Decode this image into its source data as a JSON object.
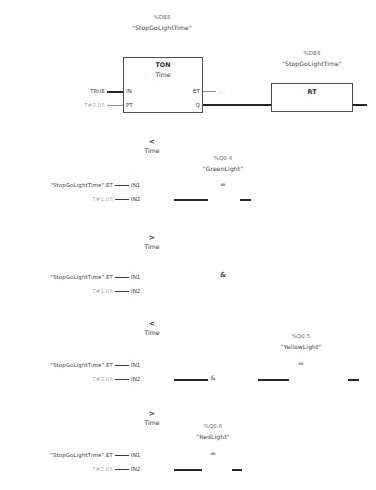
{
  "editor": {
    "language": "FBD",
    "network_title": "Traffic light timing network"
  },
  "timer": {
    "db_address": "%DB8",
    "db_name": "\"StopGoLightTime\"",
    "block_type": "TON",
    "block_subtype": "Time",
    "input_pins": [
      "IN",
      "PT"
    ],
    "output_pins": [
      "ET",
      "Q"
    ],
    "in_value": "TRUE",
    "pt_value": "T#3.0S",
    "et_value": "...",
    "reset": {
      "db_address": "%DB8",
      "db_name": "\"StopGoLightTime\"",
      "block_type": "RT"
    }
  },
  "comparators": [
    {
      "operator": "<",
      "data_type": "Time",
      "in1_label": "\"StopGoLightTime\".ET",
      "in1_pin": "IN1",
      "in2_label": "T#1.0S",
      "in2_pin": "IN2"
    },
    {
      "operator": ">",
      "data_type": "Time",
      "in1_label": "\"StopGoLightTime\".ET",
      "in1_pin": "IN1",
      "in2_label": "T#1.0S",
      "in2_pin": "IN2"
    },
    {
      "operator": "<",
      "data_type": "Time",
      "in1_label": "\"StopGoLightTime\".ET",
      "in1_pin": "IN1",
      "in2_label": "T#2.0S",
      "in2_pin": "IN2"
    },
    {
      "operator": ">",
      "data_type": "Time",
      "in1_label": "\"StopGoLightTime\".ET",
      "in1_pin": "IN1",
      "in2_label": "T#2.0S",
      "in2_pin": "IN2"
    }
  ],
  "outputs": [
    {
      "address": "%Q0.4",
      "name": "\"GreenLight\"",
      "coil_symbol": "="
    },
    {
      "address": "%Q0.5",
      "name": "\"YellowLight\"",
      "coil_symbol": "="
    },
    {
      "address": "%Q0.6",
      "name": "\"RedLight\"",
      "coil_symbol": "="
    }
  ],
  "gates": {
    "and_symbol": "&",
    "and_symbol_2": "&"
  }
}
